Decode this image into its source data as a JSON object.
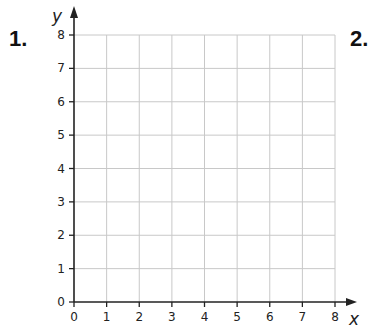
{
  "questions": [
    {
      "label": "1."
    },
    {
      "label": "2."
    }
  ],
  "chart_data": {
    "type": "grid",
    "title": "",
    "xlabel": "x",
    "ylabel": "y",
    "xlim": [
      0,
      8
    ],
    "ylim": [
      0,
      8
    ],
    "x_ticks": [
      "0",
      "1",
      "2",
      "3",
      "4",
      "5",
      "6",
      "7",
      "8"
    ],
    "y_ticks": [
      "0",
      "1",
      "2",
      "3",
      "4",
      "5",
      "6",
      "7",
      "8"
    ],
    "grid": true,
    "series": []
  },
  "colors": {
    "grid": "#c8c8c8",
    "axis": "#222222"
  }
}
